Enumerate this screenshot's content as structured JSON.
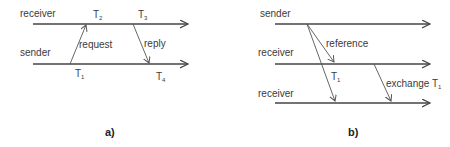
{
  "panels": [
    {
      "caption": "a)",
      "timelines": [
        {
          "label": "receiver"
        },
        {
          "label": "sender"
        }
      ],
      "messages": [
        {
          "label": "request",
          "from": "sender",
          "to": "receiver"
        },
        {
          "label": "reply",
          "from": "receiver",
          "to": "sender"
        }
      ],
      "timestamps": [
        {
          "name": "T",
          "sub": "2"
        },
        {
          "name": "T",
          "sub": "3"
        },
        {
          "name": "T",
          "sub": "1"
        },
        {
          "name": "T",
          "sub": "4"
        }
      ]
    },
    {
      "caption": "b)",
      "timelines": [
        {
          "label": "sender"
        },
        {
          "label": "receiver"
        },
        {
          "label": "receiver"
        }
      ],
      "messages": [
        {
          "label": "reference",
          "from": "sender",
          "to": "receiver 1"
        },
        {
          "label": "T",
          "sub": "1",
          "from": "sender",
          "to": "receiver 2"
        },
        {
          "label": "exchange T",
          "sub": "1",
          "from": "receiver 1",
          "to": "receiver 2"
        }
      ]
    }
  ]
}
